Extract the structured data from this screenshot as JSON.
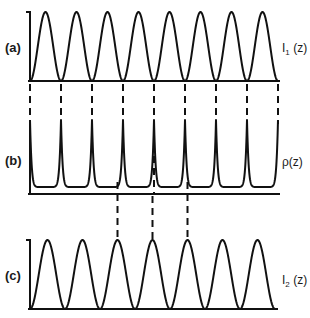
{
  "panels": [
    {
      "id": "a",
      "label": "(a)",
      "function_label": "I",
      "function_subscript": "1",
      "function_arg": " (z)",
      "shape": "sine-squared",
      "periods": 8
    },
    {
      "id": "b",
      "label": "(b)",
      "function_label": "ρ(z)",
      "function_subscript": "",
      "function_arg": "",
      "shape": "cusped",
      "periods": 8
    },
    {
      "id": "c",
      "label": "(c)",
      "function_label": "I",
      "function_subscript": "2",
      "function_arg": " (z)",
      "shape": "sine-squared",
      "periods": 7
    }
  ],
  "connectors": {
    "a_to_b": "dashed lines from each zero of I1(z) to each cusp of ρ(z)",
    "b_to_c": "dashed lines from three minima region of ρ(z) to peaks of I2(z)"
  },
  "colors": {
    "ink": "#111111",
    "background": "#ffffff"
  }
}
